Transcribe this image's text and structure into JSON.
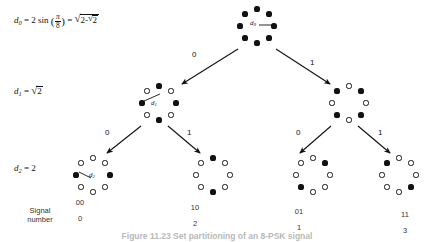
{
  "figure": {
    "caption": "Figure  11.23    Set partitioning of an 8-PSK signal",
    "signal_number_label_line1": "Signal",
    "signal_number_label_line2": "number"
  },
  "distance_labels": [
    {
      "id": "d0",
      "var": "d",
      "sub": "0",
      "expression_text": "d0 = 2 sin (π/8) = √(2-√2)",
      "parts": {
        "coef": "2 sin",
        "trig_num": "π",
        "trig_den": "8",
        "radicand_lead": "2-",
        "inner_radicand": "2"
      }
    },
    {
      "id": "d1",
      "var": "d",
      "sub": "1",
      "expression_text": "d1 = √2",
      "parts": {
        "radicand": "2"
      }
    },
    {
      "id": "d2",
      "var": "d",
      "sub": "2",
      "expression_text": "d2 = 2",
      "parts": {
        "value": "2"
      }
    }
  ],
  "edges": [
    {
      "from": "level0",
      "to": "level1-left",
      "label": "0"
    },
    {
      "from": "level0",
      "to": "level1-right",
      "label": "1"
    },
    {
      "from": "level1-left",
      "to": "level2-a",
      "label": "0"
    },
    {
      "from": "level1-left",
      "to": "level2-b",
      "label": "1"
    },
    {
      "from": "level1-right",
      "to": "level2-c",
      "label": "0"
    },
    {
      "from": "level1-right",
      "to": "level2-d",
      "label": "1"
    }
  ],
  "constellations": [
    {
      "id": "level0",
      "level": 0,
      "points": [
        "filled",
        "filled",
        "filled",
        "filled",
        "filled",
        "filled",
        "filled",
        "filled"
      ],
      "inner_label": {
        "var": "d",
        "sub": "0"
      }
    },
    {
      "id": "level1-left",
      "level": 1,
      "points": [
        "filled",
        "open",
        "filled",
        "open",
        "filled",
        "open",
        "filled",
        "open"
      ],
      "inner_label": {
        "var": "d",
        "sub": "1"
      }
    },
    {
      "id": "level1-right",
      "level": 1,
      "points": [
        "open",
        "filled",
        "open",
        "filled",
        "open",
        "filled",
        "open",
        "filled"
      ],
      "inner_label": null
    },
    {
      "id": "level2-a",
      "level": 2,
      "points": [
        "filled",
        "open",
        "open",
        "open",
        "filled",
        "open",
        "open",
        "open"
      ],
      "inner_label": {
        "var": "d",
        "sub": "2"
      }
    },
    {
      "id": "level2-b",
      "level": 2,
      "points": [
        "open",
        "open",
        "filled",
        "open",
        "open",
        "open",
        "filled",
        "open"
      ],
      "inner_label": null
    },
    {
      "id": "level2-c",
      "level": 2,
      "points": [
        "open",
        "filled",
        "open",
        "open",
        "open",
        "filled",
        "open",
        "open"
      ],
      "inner_label": null
    },
    {
      "id": "level2-d",
      "level": 2,
      "points": [
        "open",
        "open",
        "open",
        "filled",
        "open",
        "open",
        "open",
        "filled"
      ],
      "inner_label": null
    }
  ],
  "signal_numbers": [
    {
      "bits": "00",
      "number": "0"
    },
    {
      "bits": "10",
      "number": "2"
    },
    {
      "bits": "01",
      "number": "1"
    },
    {
      "bits": "11",
      "number": "3"
    }
  ],
  "colors": {
    "ink": "#111111",
    "background": "#ffffff",
    "caption": "#b9b9b9"
  }
}
